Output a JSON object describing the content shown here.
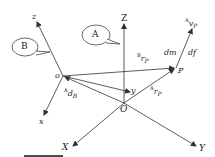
{
  "diagram": {
    "callouts": {
      "A": "A",
      "B": "B"
    },
    "global_frame": {
      "origin": "O",
      "axes": {
        "X": "X",
        "Y": "Y",
        "Z": "Z"
      }
    },
    "body_frame": {
      "origin": "o",
      "axes": {
        "x": "x",
        "y": "y",
        "z": "z"
      }
    },
    "point": "P",
    "vectors": {
      "A_d_B": {
        "sup": "A",
        "base": "d",
        "sub": "B"
      },
      "B_r_P": {
        "sup": "B",
        "base": "r",
        "sub": "P"
      },
      "A_r_P": {
        "sup": "A",
        "base": "r",
        "sub": "P"
      },
      "A_v_P": {
        "sup": "A",
        "base": "v",
        "sub": "P"
      }
    },
    "mass_element": "dm",
    "force_element": "df",
    "colors": {
      "line": "#333333",
      "text": "#222222",
      "background": "#ffffff"
    }
  }
}
